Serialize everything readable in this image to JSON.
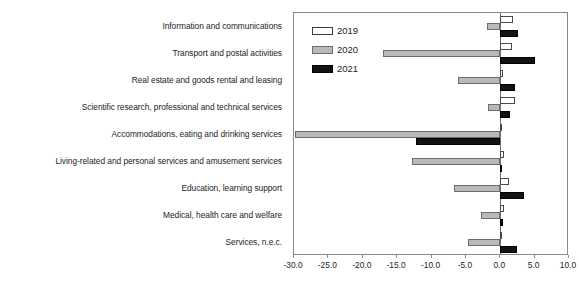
{
  "chart_data": {
    "type": "bar",
    "orientation": "horizontal",
    "title": "",
    "subtitle": "",
    "xlabel": "(%)",
    "ylabel": "",
    "unit_label": "(%)",
    "xlim": [
      -30.0,
      10.0
    ],
    "xticks": [
      -30.0,
      -25.0,
      -20.0,
      -15.0,
      -10.0,
      -5.0,
      0.0,
      5.0,
      10.0
    ],
    "xtick_labels": [
      "-30.0",
      "-25.0",
      "-20.0",
      "-15.0",
      "-10.0",
      "-5.0",
      "0.0",
      "5.0",
      "10.0"
    ],
    "grid": false,
    "legend_position": "top-left-inside",
    "categories": [
      "Information and communications",
      "Transport and postal activities",
      "Real estate and goods rental and leasing",
      "Scientific research, professional and technical services",
      "Accommodations, eating and drinking services",
      "Living-related and personal services and amusement services",
      "Education, learning support",
      "Medical, health care and welfare",
      "Services, n.e.c."
    ],
    "series": [
      {
        "name": "2019",
        "color": "#ffffff",
        "edge_color": "#4a4a4a",
        "values": [
          1.8,
          1.7,
          0.4,
          2.1,
          0.2,
          0.6,
          1.3,
          0.6,
          0.3
        ]
      },
      {
        "name": "2020",
        "color": "#b9b9b9",
        "edge_color": "#6d6d6d",
        "values": [
          -2.0,
          -17.0,
          -6.2,
          -1.8,
          -29.8,
          -12.9,
          -6.7,
          -2.8,
          -4.7
        ]
      },
      {
        "name": "2021",
        "color": "#131313",
        "edge_color": "#000000",
        "values": [
          2.6,
          5.0,
          2.1,
          1.4,
          -12.3,
          0.3,
          3.5,
          0.4,
          2.5
        ]
      }
    ]
  },
  "legend": {
    "entries": [
      {
        "label": "2019"
      },
      {
        "label": "2020"
      },
      {
        "label": "2021"
      }
    ]
  }
}
